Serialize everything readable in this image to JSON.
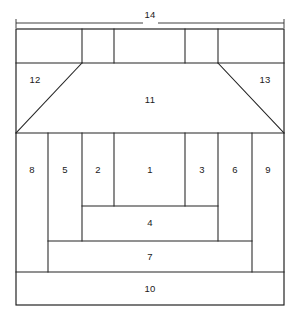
{
  "figure": {
    "type": "patent-line-drawing",
    "background_color": "#ffffff",
    "line_color": "#1b1b1b",
    "width": 300,
    "height": 317
  },
  "dimension": {
    "label": "14",
    "label_x": 150,
    "label_y": 16,
    "line_y": 23,
    "line_x1": 16,
    "line_x2": 284,
    "gap_x1": 143,
    "gap_x2": 158
  },
  "outer_frame": {
    "x": 16,
    "y": 29,
    "width": 268,
    "height": 276
  },
  "regions": [
    {
      "id": "r1",
      "label": "1",
      "label_x": 150,
      "label_y": 170
    },
    {
      "id": "r2",
      "label": "2",
      "label_x": 98,
      "label_y": 170
    },
    {
      "id": "r3",
      "label": "3",
      "label_x": 202,
      "label_y": 170
    },
    {
      "id": "r4",
      "label": "4",
      "label_x": 150,
      "label_y": 223
    },
    {
      "id": "r5",
      "label": "5",
      "label_x": 65,
      "label_y": 170
    },
    {
      "id": "r6",
      "label": "6",
      "label_x": 235,
      "label_y": 170
    },
    {
      "id": "r7",
      "label": "7",
      "label_x": 150,
      "label_y": 257
    },
    {
      "id": "r8",
      "label": "8",
      "label_x": 32,
      "label_y": 170
    },
    {
      "id": "r9",
      "label": "9",
      "label_x": 268,
      "label_y": 170
    },
    {
      "id": "r10",
      "label": "10",
      "label_x": 150,
      "label_y": 289
    },
    {
      "id": "r11",
      "label": "11",
      "label_x": 150,
      "label_y": 100
    },
    {
      "id": "r12",
      "label": "12",
      "label_x": 35,
      "label_y": 80
    },
    {
      "id": "r13",
      "label": "13",
      "label_x": 265,
      "label_y": 80
    }
  ],
  "geometry": {
    "top_band": {
      "y_top": 29,
      "y_bottom": 63,
      "dividers_x": [
        82,
        114,
        185,
        218
      ]
    },
    "trapezoid": {
      "top_left_x": 82,
      "top_right_x": 218,
      "y_top": 63,
      "bottom_left_x": 16,
      "bottom_right_x": 284,
      "y_bottom": 133
    },
    "column_band": {
      "y_top": 133,
      "y_bottom_outer": 241,
      "y_bottom_inner": 206,
      "dividers_x": [
        48,
        82,
        114,
        185,
        218,
        252
      ]
    },
    "region4": {
      "x1": 82,
      "x2": 218,
      "y_top": 206,
      "y_bottom": 241
    },
    "region7": {
      "x1": 48,
      "x2": 252,
      "y_top": 241,
      "y_bottom": 272
    },
    "region10": {
      "x1": 16,
      "x2": 284,
      "y_top": 272,
      "y_bottom": 305
    }
  }
}
